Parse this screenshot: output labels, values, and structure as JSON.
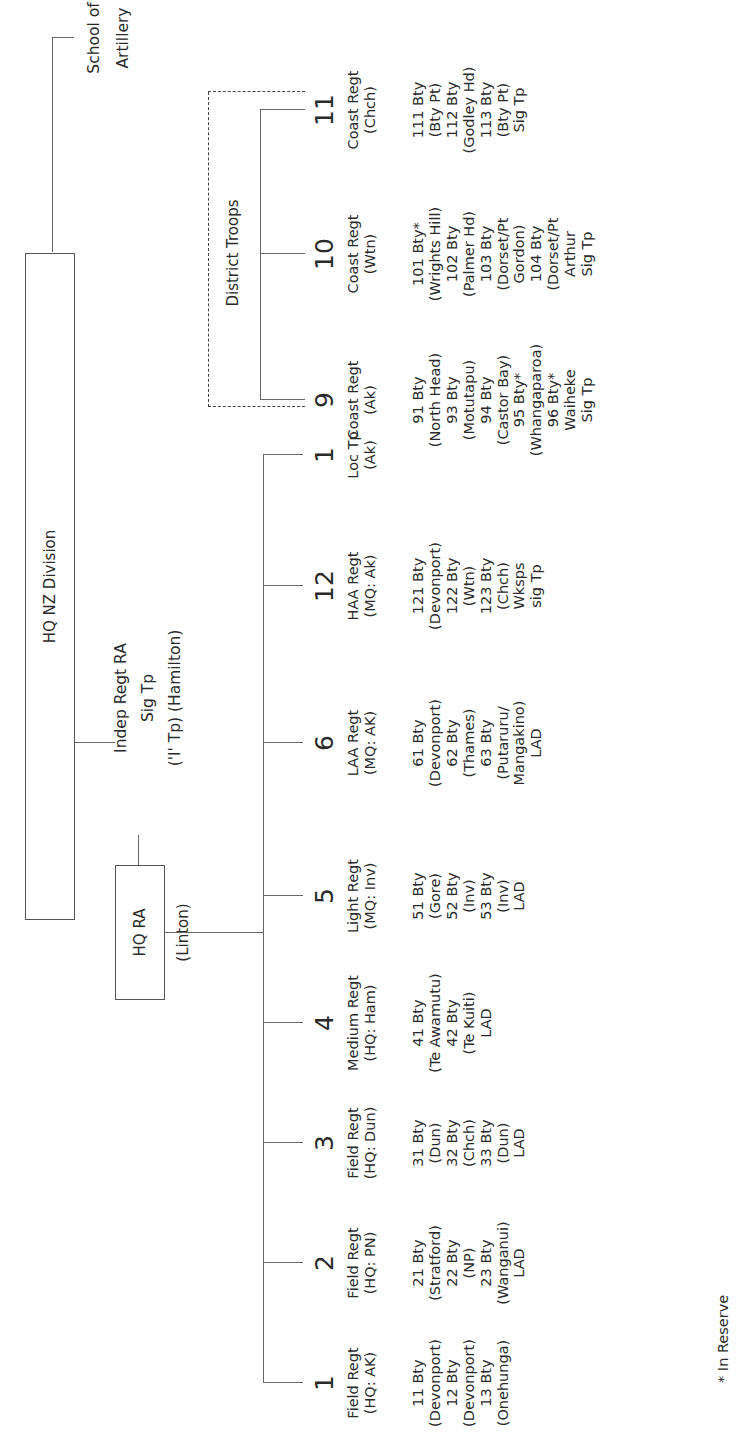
{
  "diagram": {
    "orientation": "rotated-90-ccw",
    "root": {
      "label": "HQ NZ Division"
    },
    "school": {
      "line1": "School of",
      "line2": "Artillery"
    },
    "hq_ra": {
      "label": "HQ RA",
      "location": "(Linton)"
    },
    "indep": {
      "line1": "Indep Regt RA",
      "line2": "Sig Tp",
      "line3": "('I' Tp) (Hamilton)"
    },
    "district_troops": {
      "label": "District Troops"
    },
    "footnote": "* In Reserve",
    "regiments": [
      {
        "num": "1",
        "name": "Field Regt",
        "hq": "(HQ: AK)",
        "subunits": [
          "11 Bty",
          "(Devonport)",
          "12 Bty",
          "(Devonport)",
          "13 Bty",
          "(Onehunga)"
        ]
      },
      {
        "num": "2",
        "name": "Field Regt",
        "hq": "(HQ: PN)",
        "subunits": [
          "21 Bty",
          "(Stratford)",
          "22 Bty",
          "(NP)",
          "23 Bty",
          "(Wanganui)",
          "LAD"
        ]
      },
      {
        "num": "3",
        "name": "Field Regt",
        "hq": "(HQ: Dun)",
        "subunits": [
          "31 Bty",
          "(Dun)",
          "32 Bty",
          "(Chch)",
          "33 Bty",
          "(Dun)",
          "LAD"
        ]
      },
      {
        "num": "4",
        "name": "Medium Regt",
        "hq": "(HQ: Ham)",
        "subunits": [
          "41 Bty",
          "(Te Awamutu)",
          "42 Bty",
          "(Te Kuiti)",
          "LAD"
        ]
      },
      {
        "num": "5",
        "name": "Light Regt",
        "hq": "(MQ: Inv)",
        "subunits": [
          "51 Bty",
          "(Gore)",
          "52 Bty",
          "(Inv)",
          "53 Bty",
          "(Inv)",
          "LAD"
        ]
      },
      {
        "num": "6",
        "name": "LAA Regt",
        "hq": "(MQ: AK)",
        "subunits": [
          "61 Bty",
          "(Devonport)",
          "62 Bty",
          "(Thames)",
          "63 Bty",
          "(Putaruru/",
          "Mangakino)",
          "LAD"
        ]
      },
      {
        "num": "12",
        "name": "HAA Regt",
        "hq": "(MQ: Ak)",
        "subunits": [
          "121 Bty",
          "(Devonport)",
          "122 Bty",
          "(Wtn)",
          "123 Bty",
          "(Chch)",
          "Wksps",
          "sig Tp"
        ]
      },
      {
        "num": "1",
        "name": "Loc Tp",
        "hq": "(Ak)",
        "subunits": []
      }
    ],
    "coast_regiments": [
      {
        "num": "9",
        "name": "Coast Regt",
        "hq": "(Ak)",
        "subunits": [
          "91 Bty",
          "(North Head)",
          "93 Bty",
          "(Motutapu)",
          "94 Bty",
          "(Castor Bay)",
          "95 Bty*",
          "(Whangaparoa)",
          "96 Bty*",
          "Waiheke",
          "Sig Tp"
        ]
      },
      {
        "num": "10",
        "name": "Coast Regt",
        "hq": "(Wtn)",
        "subunits": [
          "101 Bty*",
          "(Wrights Hill)",
          "102 Bty",
          "(Palmer Hd)",
          "103 Bty",
          "(Dorset/Pt",
          "Gordon)",
          "104 Bty",
          "(Dorset/Pt",
          "Arthur",
          "Sig Tp"
        ]
      },
      {
        "num": "11",
        "name": "Coast Regt",
        "hq": "(Chch)",
        "subunits": [
          "111 Bty",
          "(Bty Pt)",
          "112 Bty",
          "(Godley Hd)",
          "113 Bty",
          "(Bty Pt)",
          "Sig Tp"
        ]
      }
    ]
  }
}
